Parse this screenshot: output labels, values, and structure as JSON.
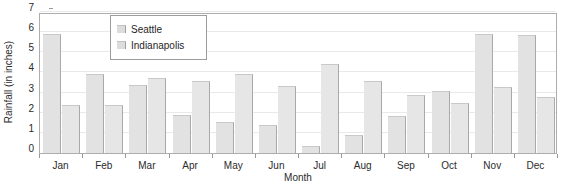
{
  "chart_data": {
    "type": "bar",
    "title": "",
    "xlabel": "Month",
    "ylabel": "Rainfall (in inches)",
    "categories": [
      "Jan",
      "Feb",
      "Mar",
      "Apr",
      "May",
      "Jun",
      "Jul",
      "Aug",
      "Sep",
      "Oct",
      "Nov",
      "Dec"
    ],
    "series": [
      {
        "name": "Seattle",
        "color": "#e2e2e2",
        "values": [
          5.9,
          3.9,
          3.4,
          1.9,
          1.55,
          1.4,
          0.35,
          0.9,
          1.85,
          3.1,
          5.9,
          5.85
        ]
      },
      {
        "name": "Indianapolis",
        "color": "#e6e6e6",
        "values": [
          2.4,
          2.4,
          3.7,
          3.6,
          3.9,
          3.35,
          4.4,
          3.6,
          2.9,
          2.5,
          3.3,
          2.8
        ]
      }
    ],
    "ylim": [
      0,
      7
    ],
    "yticks": [
      0,
      1,
      2,
      3,
      4,
      5,
      6,
      7
    ],
    "ytick_labels": [
      "0",
      "1",
      "2",
      "3",
      "4",
      "5",
      "6",
      "7"
    ],
    "grid": true,
    "legend_position": "upper-left-inset"
  },
  "legend": {
    "entries": [
      {
        "label": "Seattle"
      },
      {
        "label": "Indianapolis"
      }
    ]
  },
  "axes": {
    "y_title": "Rainfall (in inches)",
    "x_title": "Month"
  }
}
